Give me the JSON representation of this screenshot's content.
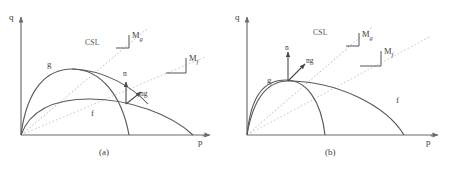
{
  "figure": {
    "panels": [
      {
        "id": "a",
        "caption": "(a)",
        "axes": {
          "y_label": "q",
          "x_label_base": "p",
          "x_label_prime": "'"
        },
        "lines": {
          "csl_label": "CSL",
          "mg_label_base": "M",
          "mg_label_sub": "g",
          "mf_label_base": "M",
          "mf_label_sub": "f"
        },
        "curves": {
          "g_label": "g",
          "f_label": "f"
        },
        "vectors": {
          "n_label": "n",
          "ng_label": "ng"
        }
      },
      {
        "id": "b",
        "caption": "(b)",
        "axes": {
          "y_label": "q",
          "x_label_base": "p",
          "x_label_prime": "'"
        },
        "lines": {
          "csl_label": "CSL",
          "mg_label_base": "M",
          "mg_label_sub": "g",
          "mf_label_base": "M",
          "mf_label_sub": "f"
        },
        "curves": {
          "g_label": "g",
          "f_label": "f"
        },
        "vectors": {
          "n_label": "n",
          "ng_label": "ng"
        }
      }
    ],
    "colors": {
      "axis": "#6b6b6b",
      "curve": "#5a5a5a",
      "dotted": "#b0b0b0",
      "text": "#444444",
      "background": "#ffffff"
    }
  }
}
